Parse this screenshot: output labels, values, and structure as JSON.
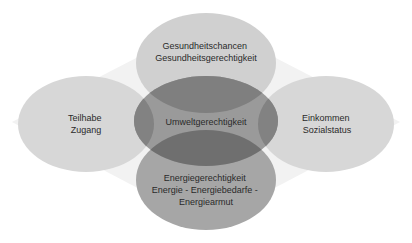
{
  "diagram": {
    "title": "",
    "center": {
      "label_lines": [
        "Umweltgerechtigkeit"
      ],
      "color": "#8c8c8c"
    },
    "nodes": [
      {
        "id": "top",
        "label_lines": [
          "Gesundheitschancen",
          "Gesundheitsgerechtigkeit"
        ],
        "color": "#cfcfcf"
      },
      {
        "id": "left",
        "label_lines": [
          "Teilhabe",
          "Zugang"
        ],
        "color": "#d6d6d6"
      },
      {
        "id": "right",
        "label_lines": [
          "Einkommen",
          "Sozialstatus"
        ],
        "color": "#d6d6d6"
      },
      {
        "id": "bottom",
        "label_lines": [
          "Energiegerechtigkeit",
          "Energie - Energiebedarfe -",
          "Energiearmut"
        ],
        "color": "#a3a3a3"
      }
    ],
    "background_color": "#f1f1f1"
  }
}
